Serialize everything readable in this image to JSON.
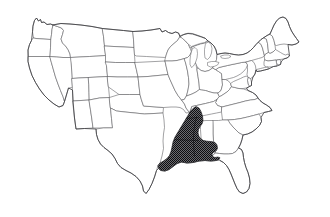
{
  "figure": {
    "kind": "choropleth-outline-map",
    "region_name": "United States",
    "projection_note": "",
    "caption": "",
    "title": "",
    "width_px": 330,
    "height_px": 217
  },
  "colors": {
    "background": "#ffffff",
    "state_fill": "#ffffff",
    "state_border": "#555558",
    "nation_border": "#3a3a3d",
    "highlight_fill": "#4a4a4d",
    "highlight_pattern_dot": "#0d0d10",
    "highlight_border": "#111114"
  },
  "legend": {
    "visible": false,
    "entries": [
      {
        "label": "Highlighted range",
        "color": "#4a4a4d",
        "pattern": "dense-stipple"
      },
      {
        "label": "Not in range",
        "color": "#ffffff",
        "pattern": "none"
      }
    ]
  },
  "map_data": {
    "type": "categorical-highlight",
    "highlight_pattern": "dense-stipple",
    "highlighted_states": [
      "Arkansas",
      "Louisiana",
      "Mississippi",
      "Missouri (southeast bootheel)",
      "Tennessee (west)",
      "Texas (east)",
      "Alabama (west edge)"
    ],
    "unhighlighted_states": [
      "Washington",
      "Oregon",
      "California",
      "Nevada",
      "Idaho",
      "Montana",
      "Wyoming",
      "Utah",
      "Arizona",
      "Colorado",
      "New Mexico",
      "North Dakota",
      "South Dakota",
      "Nebraska",
      "Kansas",
      "Oklahoma",
      "Minnesota",
      "Iowa",
      "Wisconsin",
      "Illinois",
      "Michigan",
      "Indiana",
      "Ohio",
      "Kentucky",
      "West Virginia",
      "Virginia",
      "Pennsylvania",
      "New York",
      "Vermont",
      "New Hampshire",
      "Maine",
      "Massachusetts",
      "Rhode Island",
      "Connecticut",
      "New Jersey",
      "Delaware",
      "Maryland",
      "North Carolina",
      "South Carolina",
      "Georgia",
      "Florida"
    ],
    "highlight_extent_description": "Lower Mississippi River valley, from the Missouri bootheel south through Arkansas, Louisiana and Mississippi to the Gulf of Mexico, reaching west into east Texas",
    "labels_shown": false,
    "graticule_shown": false,
    "insets": []
  }
}
